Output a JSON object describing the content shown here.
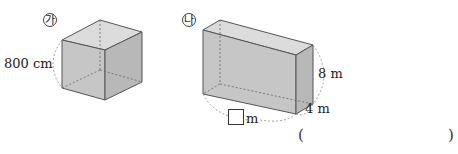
{
  "figure_a": {
    "marker": "㉮",
    "shape": "cube",
    "edge_label": "800 cm"
  },
  "figure_b": {
    "marker": "㉯",
    "shape": "rectangular-prism",
    "height_label": "8 m",
    "depth_label": "4 m",
    "length_label_suffix": "m",
    "length_blank": ""
  },
  "answer": {
    "open_paren": "(",
    "close_paren": ")",
    "value": ""
  }
}
